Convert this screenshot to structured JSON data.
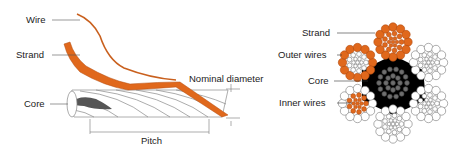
{
  "left_diagram": {
    "labels": {
      "wire": "Wire",
      "strand": "Strand",
      "core": "Core",
      "nominal_diameter": "Nominal diameter",
      "pitch": "Pitch"
    }
  },
  "right_diagram": {
    "labels": {
      "strand": "Strand",
      "outer_wires": "Outer wires",
      "core": "Core",
      "inner_wires": "Inner wires"
    }
  },
  "colors": {
    "orange": "#e0681c",
    "core_black": "#000000",
    "core_wire_gray": "#6e6e6e",
    "outline": "#888888"
  }
}
